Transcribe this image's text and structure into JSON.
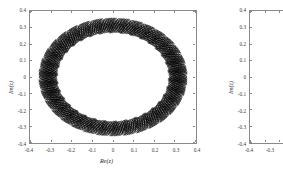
{
  "figure": {
    "background_color": "#ffffff",
    "axis_color": "#8a8a8a",
    "curve_color": "#000000",
    "panels": [
      {
        "id": "panel-left",
        "xlabel": "Re(z)",
        "ylabel": "Im(z)",
        "xticks": [
          "-0.4",
          "-0.3",
          "-0.2",
          "-0.1",
          "0",
          "0.1",
          "0.2",
          "0.3",
          "0.4"
        ],
        "yticks": [
          "0.4",
          "0.3",
          "0.2",
          "0.1",
          "0",
          "-0.1",
          "-0.2",
          "-0.3",
          "-0.4"
        ],
        "xlim": [
          -0.4,
          0.4
        ],
        "ylim": [
          -0.4,
          0.4
        ],
        "has_data": true
      },
      {
        "id": "panel-right",
        "xlabel": "",
        "ylabel": "Im(z)",
        "xticks": [
          "-0.4",
          "-0.3"
        ],
        "yticks": [
          "0.4",
          "0.3",
          "0.2",
          "0.1",
          "0",
          "-0.1",
          "-0.2",
          "-0.3",
          "-0.4"
        ],
        "xlim": [
          -0.4,
          0.4
        ],
        "ylim": [
          -0.4,
          0.4
        ],
        "has_data": false
      }
    ]
  },
  "chart_data": {
    "type": "line",
    "title": "",
    "xlabel": "Re(z)",
    "ylabel": "Im(z)",
    "xlim": [
      -0.4,
      0.4
    ],
    "ylim": [
      -0.4,
      0.4
    ],
    "xticks": [
      -0.4,
      -0.3,
      -0.2,
      -0.1,
      0,
      0.1,
      0.2,
      0.3,
      0.4
    ],
    "yticks": [
      -0.4,
      -0.3,
      -0.2,
      -0.1,
      0,
      0.1,
      0.2,
      0.3,
      0.4
    ],
    "grid": false,
    "legend": null,
    "series": [
      {
        "name": "orbit-band",
        "geometry": "annulus",
        "center": [
          0.0,
          0.0
        ],
        "inner_radius": 0.275,
        "outer_radius": 0.345,
        "mean_radius": 0.31,
        "radial_modulation_amplitude": 0.035,
        "angular_modes": 34,
        "num_curves": 26,
        "curve_color": "#000000"
      }
    ]
  }
}
